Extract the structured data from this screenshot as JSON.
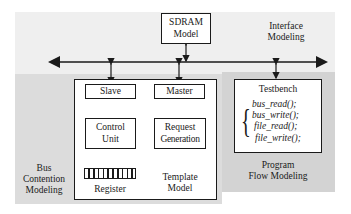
{
  "diagram": {
    "regions": {
      "interface": {
        "label_line1": "Interface",
        "label_line2": "Modeling"
      },
      "bus_contention": {
        "label_line1": "Bus",
        "label_line2": "Contention",
        "label_line3": "Modeling"
      },
      "program_flow": {
        "label_line1": "Program",
        "label_line2": "Flow Modeling"
      }
    },
    "sdram": {
      "line1": "SDRAM",
      "line2": "Model"
    },
    "template_model": {
      "label_line1": "Template",
      "label_line2": "Model",
      "slave": "Slave",
      "master": "Master",
      "control_unit": {
        "line1": "Control",
        "line2": "Unit"
      },
      "request_generation": {
        "line1": "Request",
        "line2": "Generation"
      },
      "register": "Register"
    },
    "testbench": {
      "title": "Testbench",
      "functions": [
        "bus_read();",
        "bus_write();",
        "file_read();",
        "file_write();"
      ]
    },
    "colors": {
      "interface_bg": "#efefef",
      "bus_contention_bg": "#dcdcdc",
      "program_flow_bg": "#d3d3d3",
      "line": "#1a1a1a"
    }
  }
}
